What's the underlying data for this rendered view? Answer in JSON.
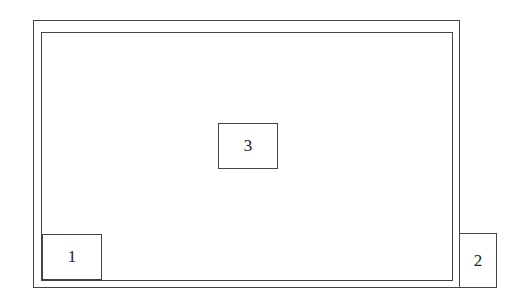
{
  "diagram": {
    "outer_frame": {
      "label": ""
    },
    "inner_frame": {
      "label": ""
    },
    "boxes": [
      {
        "label": "1"
      },
      {
        "label": "2"
      },
      {
        "label": "3"
      }
    ]
  },
  "colors": {
    "stroke": "#444444",
    "background": "#ffffff",
    "text": "#222222"
  }
}
